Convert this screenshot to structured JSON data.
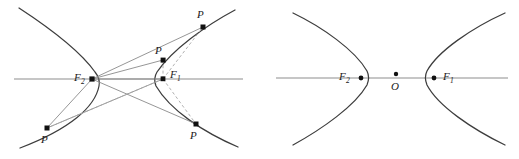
{
  "figure": {
    "title": "",
    "colors": {
      "curve": "#3d3d3d",
      "axis": "#b3b3b3",
      "ray_solid": "#8a8a8a",
      "ray_dashed": "#a8a8a8",
      "point": "#111111",
      "label": "#1a1a1a",
      "background": "#ffffff"
    },
    "panels": [
      {
        "id": "left-panel",
        "name": "hyperbola-with-focal-rays",
        "axis": {
          "x1": 14,
          "x2": 243,
          "y": 79
        },
        "foci": [
          {
            "name": "F2",
            "label": "F",
            "subscript": "2",
            "x": 92,
            "y": 79,
            "label_x": 74,
            "label_y": 77
          },
          {
            "name": "F1",
            "label": "F",
            "subscript": "1",
            "x": 163,
            "y": 79,
            "label_x": 170,
            "label_y": 77
          }
        ],
        "points": [
          {
            "name": "P-top-right",
            "label": "P",
            "x": 203,
            "y": 27,
            "label_x": 197,
            "label_y": 18
          },
          {
            "name": "P-upper-mid",
            "label": "P",
            "x": 163,
            "y": 60,
            "label_x": 156,
            "label_y": 53
          },
          {
            "name": "P-bottom-left",
            "label": "P",
            "x": 47,
            "y": 128,
            "label_x": 42,
            "label_y": 142
          },
          {
            "name": "P-bottom-right",
            "label": "P",
            "x": 196,
            "y": 124,
            "label_x": 191,
            "label_y": 138
          }
        ]
      },
      {
        "id": "right-panel",
        "name": "hyperbola-with-center",
        "axis": {
          "x1": 276,
          "x2": 508,
          "y": 78
        },
        "foci": [
          {
            "name": "F2",
            "label": "F",
            "subscript": "2",
            "x": 361,
            "y": 78,
            "label_x": 340,
            "label_y": 76
          },
          {
            "name": "F1",
            "label": "F",
            "subscript": "1",
            "x": 434,
            "y": 78,
            "label_x": 443,
            "label_y": 76
          }
        ],
        "center": {
          "name": "O",
          "label": "O",
          "x": 396,
          "y": 74,
          "label_x": 392,
          "label_y": 88
        }
      }
    ],
    "legend_note": ""
  }
}
